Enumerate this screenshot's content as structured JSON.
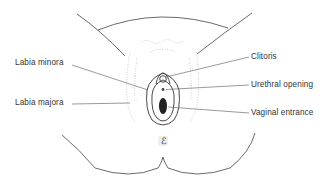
{
  "diagram": {
    "labels": {
      "labia_minora": "Labia minora",
      "labia_majora": "Labia majora",
      "clitoris": "Clitoris",
      "urethral_opening": "Urethral opening",
      "vaginal_entrance": "Vaginal entrance"
    },
    "colors": {
      "line": "#333333",
      "hair": "#9a9a9a",
      "fill_dark": "#222222",
      "background": "#ffffff"
    }
  }
}
